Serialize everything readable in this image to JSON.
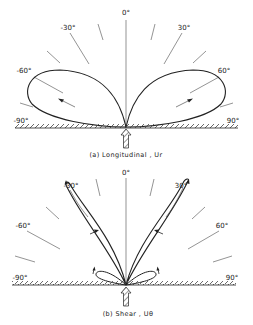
{
  "figure": {
    "panels": [
      {
        "id": "a",
        "caption": "(a)  Longitudinal , Ur",
        "angle_labels": {
          "zero": "0°",
          "neg30": "-30°",
          "pos30": "30°",
          "neg60": "-60°",
          "pos60": "60°",
          "neg90": "-90°",
          "pos90": "90°"
        },
        "pattern": "two broad lobes peaking near ±60°"
      },
      {
        "id": "b",
        "caption": "(b)  Shear , Uθ",
        "angle_labels": {
          "zero": "0°",
          "neg30": "-30°",
          "pos30": "30°",
          "neg60": "-60°",
          "pos60": "60°",
          "neg90": "-90°",
          "pos90": "90°"
        },
        "pattern": "two narrow lobes near ±30° plus small side lobes near ±80°"
      }
    ],
    "colors": {
      "ink": "#222222",
      "guide": "#555555",
      "background": "#ffffff"
    }
  }
}
